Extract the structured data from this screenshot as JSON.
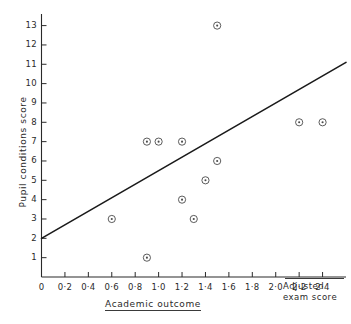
{
  "chart_data": {
    "type": "scatter",
    "title": "",
    "subtitle": "",
    "xlabel": "Academic outcome",
    "ylabel": "Pupil conditions score",
    "axis_right_label_line1": "Adjusted",
    "axis_right_label_line2": "exam score",
    "xlim": [
      0,
      2.6
    ],
    "ylim": [
      0,
      13.6
    ],
    "grid": false,
    "legend": "none",
    "marker": "circle-with-center-dot",
    "x_ticks": [
      0,
      0.2,
      0.4,
      0.6,
      0.8,
      1.0,
      1.2,
      1.4,
      1.6,
      1.8,
      2.0,
      2.2,
      2.4
    ],
    "x_tick_labels": [
      "0",
      "0·2",
      "0·4",
      "0·6",
      "0·8",
      "1·0",
      "1·2",
      "1·4",
      "1·6",
      "1·8",
      "2·0",
      "2·2",
      "2·4"
    ],
    "y_ticks": [
      1,
      2,
      3,
      4,
      5,
      6,
      7,
      8,
      9,
      10,
      11,
      12,
      13
    ],
    "y_tick_labels": [
      "1",
      "2",
      "3",
      "4",
      "5",
      "6",
      "7",
      "8",
      "9",
      "10",
      "11",
      "12",
      "13"
    ],
    "points": [
      {
        "x": 0.6,
        "y": 3
      },
      {
        "x": 0.9,
        "y": 7
      },
      {
        "x": 0.9,
        "y": 1
      },
      {
        "x": 1.0,
        "y": 7
      },
      {
        "x": 1.2,
        "y": 7
      },
      {
        "x": 1.2,
        "y": 4
      },
      {
        "x": 1.3,
        "y": 3
      },
      {
        "x": 1.4,
        "y": 5
      },
      {
        "x": 1.5,
        "y": 6
      },
      {
        "x": 1.5,
        "y": 13
      },
      {
        "x": 2.2,
        "y": 8
      },
      {
        "x": 2.4,
        "y": 8
      }
    ],
    "series": [
      {
        "name": "observations",
        "values": [
          3,
          7,
          1,
          7,
          7,
          4,
          3,
          5,
          6,
          13,
          8,
          8
        ],
        "x": [
          0.6,
          0.9,
          0.9,
          1.0,
          1.2,
          1.2,
          1.3,
          1.4,
          1.5,
          1.5,
          2.2,
          2.4
        ]
      }
    ],
    "fit_line": {
      "type": "line",
      "name": "regression line",
      "x_start": 0.0,
      "y_start": 2.0,
      "x_end": 2.6,
      "y_end": 11.1,
      "intercept": 2.0,
      "slope": 3.5
    },
    "colors": {
      "axis": "#2a2a2a",
      "marker": "#4a4a4a",
      "line": "#1a1a1a",
      "background": "#ffffff"
    }
  }
}
